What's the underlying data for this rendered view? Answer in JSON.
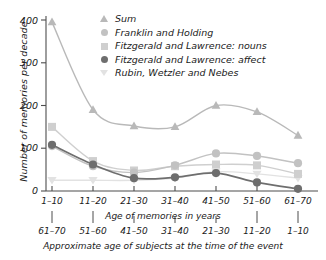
{
  "chart_data": {
    "type": "line",
    "title": "",
    "ylabel": "Number of memories per decade",
    "xlabel_top": "Age of memories in years",
    "xlabel_bottom": "Approximate age of subjects at the time of the event",
    "categories": [
      "1–10",
      "11–20",
      "21–30",
      "31–40",
      "41–50",
      "51–60",
      "61–70"
    ],
    "categories_secondary": [
      "61–70",
      "51–60",
      "41–50",
      "31–40",
      "21–30",
      "11–20",
      "1–10"
    ],
    "ylim": [
      0,
      420
    ],
    "yticks": [
      0,
      100,
      200,
      300,
      400
    ],
    "ytick_labels": [
      "0",
      "100",
      "200",
      "300",
      "400"
    ],
    "grid": false,
    "legend_position": "top-right",
    "series": [
      {
        "name": "Sum",
        "marker": "triangle",
        "color": "#b9b9b9",
        "values": [
          395,
          190,
          152,
          150,
          200,
          185,
          130
        ]
      },
      {
        "name": "Franklin and Holding",
        "marker": "circle",
        "color": "#c2c2c2",
        "values": [
          105,
          58,
          43,
          60,
          88,
          82,
          65
        ]
      },
      {
        "name": "Fitzgerald and Lawrence: nouns",
        "marker": "square",
        "color": "#cfcfcf",
        "values": [
          150,
          70,
          48,
          58,
          62,
          60,
          40
        ]
      },
      {
        "name": "Fitzgerald and Lawrence: affect",
        "marker": "circle-filled",
        "color": "#6e6e6e",
        "values": [
          108,
          62,
          30,
          32,
          42,
          20,
          5
        ]
      },
      {
        "name": "Rubin, Wetzler and Nebes",
        "marker": "triangle-down",
        "color": "#e2e2e2",
        "values": [
          25,
          25,
          25,
          30,
          45,
          40,
          30
        ]
      }
    ]
  },
  "legend": {
    "items": [
      {
        "label": "Sum",
        "marker": "triangle-up-icon"
      },
      {
        "label": "Franklin and Holding",
        "marker": "circle-icon"
      },
      {
        "label": "Fitzgerald and Lawrence: nouns",
        "marker": "square-icon"
      },
      {
        "label": "Fitzgerald and Lawrence: affect",
        "marker": "circle-filled-icon"
      },
      {
        "label": "Rubin, Wetzler and Nebes",
        "marker": "triangle-down-icon"
      }
    ]
  },
  "axes": {
    "y_title": "Number of memories per decade",
    "y_ticks": [
      "400",
      "300",
      "200",
      "100",
      "0"
    ],
    "x_top_ticks": [
      "1–10",
      "11–20",
      "21–30",
      "31–40",
      "41–50",
      "51–60",
      "61–70"
    ],
    "x_top_title": "Age of memories in years",
    "x_bottom_ticks": [
      "61–70",
      "51–60",
      "41–50",
      "31–40",
      "21–30",
      "11–20",
      "1–10"
    ],
    "x_bottom_title": "Approximate age of subjects at the time of the event"
  }
}
